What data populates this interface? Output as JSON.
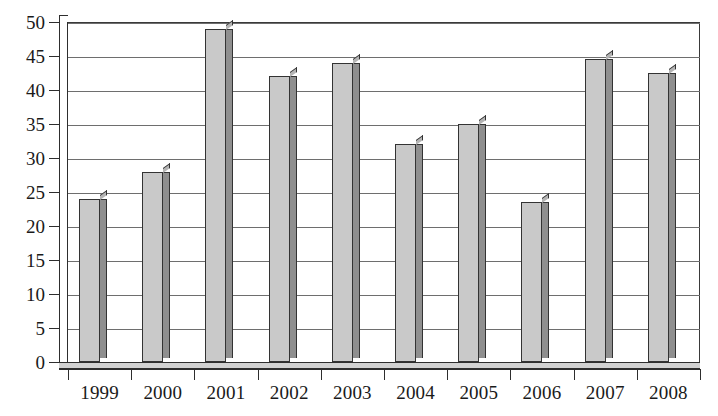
{
  "chart_data": {
    "type": "bar",
    "title": "",
    "subtitle": "",
    "xlabel": "",
    "ylabel": "",
    "categories": [
      "1999",
      "2000",
      "2001",
      "2002",
      "2003",
      "2004",
      "2005",
      "2006",
      "2007",
      "2008"
    ],
    "values": [
      24,
      28,
      49,
      42,
      44,
      32,
      35,
      23.5,
      44.5,
      42.5
    ],
    "ylim": [
      0,
      50
    ],
    "ytick_values": [
      0,
      5,
      10,
      15,
      20,
      25,
      30,
      35,
      40,
      45,
      50
    ],
    "ytick_labels": [
      "0",
      "5",
      "10",
      "15",
      "20",
      "25",
      "30",
      "35",
      "40",
      "45",
      "50"
    ],
    "grid": "horizontal",
    "legend": "none",
    "series": [
      {
        "name": "",
        "values": [
          24,
          28,
          49,
          42,
          44,
          32,
          35,
          23.5,
          44.5,
          42.5
        ]
      }
    ],
    "style": {
      "bar_face_color": "#c9c9c9",
      "bar_side_color": "#8f8f8f",
      "bar_top_color": "#b4b4b4",
      "bar_edge_color": "#333333",
      "axis_color": "#2e2e2e",
      "gridline_color": "#6e6e6e",
      "plot_background": "#ffffff",
      "three_d": true
    }
  }
}
